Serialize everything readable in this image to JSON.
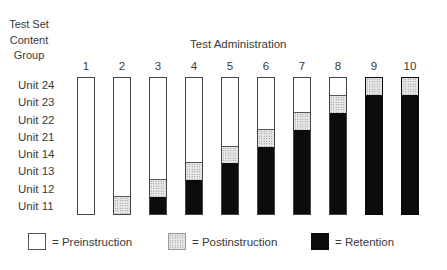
{
  "chart_data": {
    "type": "bar",
    "stacked": true,
    "title": "",
    "ylabel": "Test Set Content Group",
    "xlabel": "Test Administration",
    "categories": [
      "1",
      "2",
      "3",
      "4",
      "5",
      "6",
      "7",
      "8",
      "9",
      "10"
    ],
    "row_labels_top_to_bottom": [
      "Unit 24",
      "Unit 23",
      "Unit 22",
      "Unit 21",
      "Unit 14",
      "Unit 13",
      "Unit 12",
      "Unit 11"
    ],
    "total_units": 8,
    "series": [
      {
        "name": "Retention",
        "color": "#0b0b0b",
        "values": [
          0,
          0,
          1,
          2,
          3,
          4,
          5,
          6,
          7,
          7
        ]
      },
      {
        "name": "Postinstruction",
        "color": "#d0d0d0",
        "pattern": "dotted",
        "values": [
          0,
          1,
          1,
          1,
          1,
          1,
          1,
          1,
          1,
          1
        ]
      },
      {
        "name": "Preinstruction",
        "color": "#ffffff",
        "values": [
          8,
          7,
          6,
          5,
          4,
          3,
          2,
          1,
          0,
          0
        ]
      }
    ],
    "legend": [
      "= Preinstruction",
      "= Postinstruction",
      "= Retention"
    ],
    "legend_position": "bottom",
    "grid": false
  },
  "labels": {
    "ylab_line1": "Test Set",
    "ylab_line2": "Content",
    "ylab_line3": "Group",
    "xtitle": "Test Administration",
    "rows": [
      "Unit 24",
      "Unit 23",
      "Unit 22",
      "Unit 21",
      "Unit 14",
      "Unit 13",
      "Unit 12",
      "Unit 11"
    ],
    "cols": [
      "1",
      "2",
      "3",
      "4",
      "5",
      "6",
      "7",
      "8",
      "9",
      "10"
    ]
  },
  "legend": {
    "pre": "= Preinstruction",
    "post": "= Postinstruction",
    "ret": "= Retention"
  }
}
